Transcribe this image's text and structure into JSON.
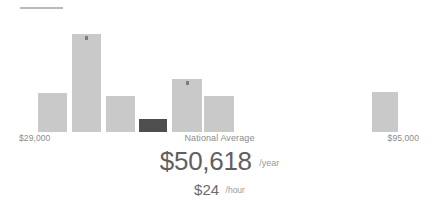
{
  "widget": {
    "divider_icon": "horizontal-rule-divider"
  },
  "axis": {
    "min_label": "$29,000",
    "max_label": "$95,000",
    "center_label": "National Average"
  },
  "summary": {
    "annual_amount": "$50,618",
    "annual_unit": "/year",
    "hourly_amount": "$24",
    "hourly_unit": "/hour"
  },
  "colors": {
    "bar": "#c9c9c9",
    "bar_highlight": "#4e4e4e",
    "marker": "#7d7d7d",
    "label_text": "#8c8c8c",
    "value_text": "#5f5f5f",
    "unit_text": "#9a9a9a",
    "divider": "#b9b9b9"
  },
  "chart_data": {
    "type": "bar",
    "title": "",
    "subtitle": "",
    "xlabel": "",
    "ylabel": "",
    "grid": false,
    "legend": "none",
    "categories": [
      "29000",
      "38000",
      "47000",
      "56000",
      "65000",
      "74000",
      "83000",
      "92000"
    ],
    "tick_labels": [
      "$29,000",
      "National Average",
      "$95,000"
    ],
    "values": [
      39,
      98,
      36,
      13,
      53,
      36,
      0,
      40
    ],
    "ylim": [
      0,
      132
    ],
    "annotations": [
      "$50,618 /year",
      "$24 /hour"
    ],
    "bars": [
      {
        "x": 38,
        "width": 29,
        "height": 39,
        "highlight": false,
        "marker": false
      },
      {
        "x": 72,
        "width": 29,
        "height": 98,
        "highlight": false,
        "marker": true
      },
      {
        "x": 106,
        "width": 29,
        "height": 36,
        "highlight": false,
        "marker": false
      },
      {
        "x": 139,
        "width": 28,
        "height": 13,
        "highlight": true,
        "marker": false
      },
      {
        "x": 172,
        "width": 30,
        "height": 53,
        "highlight": false,
        "marker": true
      },
      {
        "x": 204,
        "width": 30,
        "height": 36,
        "highlight": false,
        "marker": false
      },
      {
        "x": 372,
        "width": 26,
        "height": 40,
        "highlight": false,
        "marker": false
      }
    ]
  }
}
